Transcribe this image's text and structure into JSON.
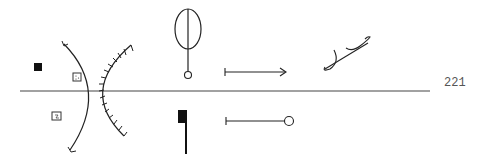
{
  "page": {
    "number": "221"
  },
  "diagram": {
    "type": "optical-symbols",
    "axis": {
      "color": "#444444"
    },
    "ink_color": "#222222",
    "elements": [
      {
        "name": "filled-square-marker"
      },
      {
        "name": "dotted-box-upper"
      },
      {
        "name": "dotted-box-lower"
      },
      {
        "name": "concave-lens-arc"
      },
      {
        "name": "hatched-mirror-arc"
      },
      {
        "name": "loop-pin-symbol"
      },
      {
        "name": "flag-post-symbol"
      },
      {
        "name": "arrow-right-symbol"
      },
      {
        "name": "circle-terminated-line"
      },
      {
        "name": "curl-stroke-symbol"
      }
    ]
  }
}
